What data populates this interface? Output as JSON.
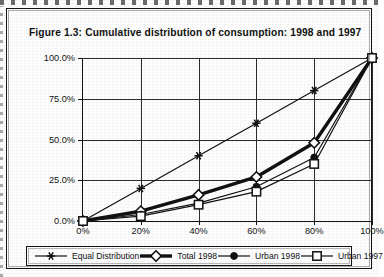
{
  "figure": {
    "title": "Figure 1.3:  Cumulative distribution of consumption: 1998 and 1997"
  },
  "legend": {
    "items": [
      {
        "label": "Equal Distribution",
        "marker": "star-marker",
        "color": "#111111",
        "thick": false
      },
      {
        "label": "Total 1998",
        "marker": "diamond-open-marker",
        "color": "#111111",
        "thick": true
      },
      {
        "label": "Urban 1998",
        "marker": "circle-filled-marker",
        "color": "#111111",
        "thick": false
      },
      {
        "label": "Urban 1997",
        "marker": "square-open-marker",
        "color": "#111111",
        "thick": false
      }
    ]
  },
  "axes": {
    "y_ticks": [
      "0.0%",
      "25.0%",
      "50.0%",
      "75.0%",
      "100.0%"
    ],
    "x_ticks": [
      "0%",
      "20%",
      "40%",
      "60%",
      "80%",
      "100%"
    ],
    "x_last_clipped": "100%"
  },
  "chart_data": {
    "type": "line",
    "title": "Figure 1.3:  Cumulative distribution of consumption: 1998 and 1997",
    "xlabel": "",
    "ylabel": "",
    "xlim": [
      0,
      100
    ],
    "ylim": [
      0,
      100
    ],
    "grid": true,
    "legend_position": "bottom",
    "x": [
      0,
      20,
      40,
      60,
      80,
      100
    ],
    "series": [
      {
        "name": "Equal Distribution",
        "marker": "star",
        "values": [
          0,
          20,
          40,
          60,
          80,
          100
        ]
      },
      {
        "name": "Total 1998",
        "marker": "diamond-open",
        "values": [
          0,
          6,
          16,
          27,
          48,
          100
        ]
      },
      {
        "name": "Urban 1998",
        "marker": "circle-filled",
        "values": [
          0,
          4,
          11,
          21,
          39,
          100
        ]
      },
      {
        "name": "Urban 1997",
        "marker": "square-open",
        "values": [
          0,
          3,
          10,
          18,
          35,
          100
        ]
      }
    ]
  }
}
